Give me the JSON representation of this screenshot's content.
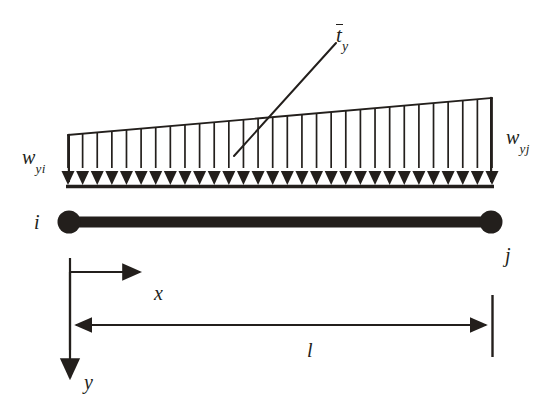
{
  "figure": {
    "type": "structural-beam-distributed-load-diagram",
    "background_color": "#ffffff",
    "ink_color": "#231f1c",
    "labels": {
      "traction": {
        "symbol": "t",
        "overbar": true,
        "subscript": "y",
        "text": "t̄y"
      },
      "load_left": {
        "symbol": "w",
        "subscript": "yi",
        "text": "wyi"
      },
      "load_right": {
        "symbol": "w",
        "subscript": "yj",
        "text": "wyj"
      },
      "node_start": "i",
      "node_end": "j",
      "axis_x": "x",
      "axis_y": "y",
      "length": "l"
    }
  },
  "chart_data": {
    "type": "area",
    "xlabel": "x",
    "ylabel": "y",
    "x": [
      0,
      1
    ],
    "series": [
      {
        "name": "distributed load intensity",
        "points": [
          {
            "x": 0,
            "label": "wyi",
            "intensity": 0.52
          },
          {
            "x": 1,
            "label": "wyj",
            "intensity": 1.0
          }
        ]
      }
    ],
    "annotations": [
      {
        "text": "t̄y",
        "target": "load top edge",
        "leader": true
      },
      {
        "text": "l",
        "target": "beam span dimension",
        "leader": false
      }
    ],
    "load_arrow_count": 30,
    "grid": false,
    "legend": null
  },
  "geometry": {
    "load_left_x": 68,
    "load_right_x": 492,
    "load_top_left_y": 135,
    "load_top_right_y": 98,
    "load_baseline_y": 180,
    "beam_y": 222,
    "node_radius": 11,
    "dimension_line_y": 325,
    "x_axis_arrow_y": 272,
    "y_axis_arrow_x": 70
  }
}
